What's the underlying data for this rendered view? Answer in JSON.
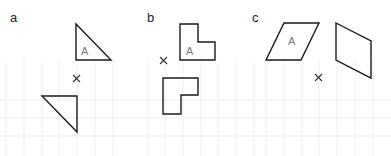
{
  "panels": [
    {
      "label": "a",
      "shape_label": "A",
      "transformation_center": "×"
    },
    {
      "label": "b",
      "shape_label": "A",
      "transformation_center": "×"
    },
    {
      "label": "c",
      "shape_label": "A",
      "transformation_center": "×"
    }
  ],
  "colors": {
    "stroke": "#1a1a1a",
    "grid": "#eeeeee",
    "label": "#777777"
  }
}
